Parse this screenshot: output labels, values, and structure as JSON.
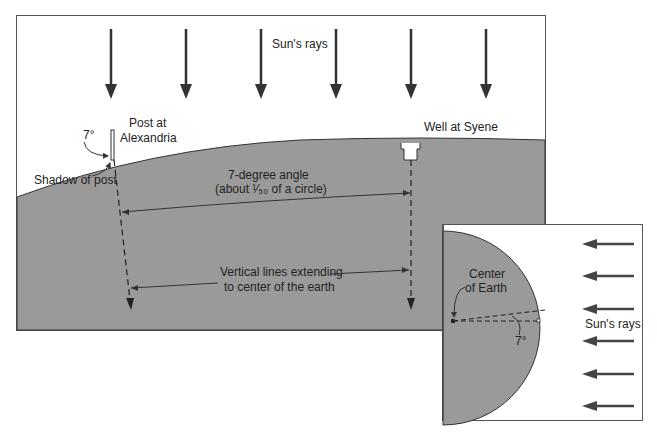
{
  "main_panel": {
    "sun_rays_label": "Sun's rays",
    "post_label_line1": "Post at",
    "post_label_line2": "Alexandria",
    "post_angle_label": "7°",
    "shadow_label": "Shadow of post",
    "well_label": "Well at Syene",
    "angle_label_line1": "7-degree angle",
    "angle_label_line2": "(about ¹⁄₅₀ of a circle)",
    "vertical_label_line1": "Vertical lines extending",
    "vertical_label_line2": "to center of the earth"
  },
  "inset_panel": {
    "center_label_line1": "Center",
    "center_label_line2": "of Earth",
    "angle_label": "7°",
    "sun_rays_label": "Sun's rays"
  },
  "colors": {
    "earth_fill": "#9a9a9a",
    "sky_fill": "#ffffff",
    "line": "#333333",
    "arrow": "#444444"
  }
}
